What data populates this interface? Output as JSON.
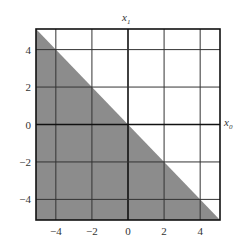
{
  "chart_data": {
    "type": "area",
    "title": "",
    "xlabel": "x0",
    "ylabel": "x1",
    "xlim": [
      -5.1,
      5.1
    ],
    "ylim": [
      -5.1,
      5.1
    ],
    "grid": true,
    "xticks": [
      -4,
      -2,
      0,
      2,
      4
    ],
    "yticks": [
      -4,
      -2,
      0,
      2,
      4
    ],
    "xtick_labels": [
      "−4",
      "−2",
      "0",
      "2",
      "4"
    ],
    "ytick_labels": [
      "−4",
      "−2",
      "0",
      "2",
      "4"
    ],
    "region": {
      "description": "Shaded half-plane x0 + x1 <= 0 (below the line x1 = -x0)",
      "boundary_line": {
        "slope": -1,
        "intercept": 0
      },
      "fill_color": "#8c8c8c",
      "polygon": [
        [
          -5.1,
          5.1
        ],
        [
          5.1,
          -5.1
        ],
        [
          -5.1,
          -5.1
        ]
      ]
    }
  },
  "labels": {
    "x_axis": "x",
    "x_axis_sub": "0",
    "y_axis": "x",
    "y_axis_sub": "1"
  }
}
